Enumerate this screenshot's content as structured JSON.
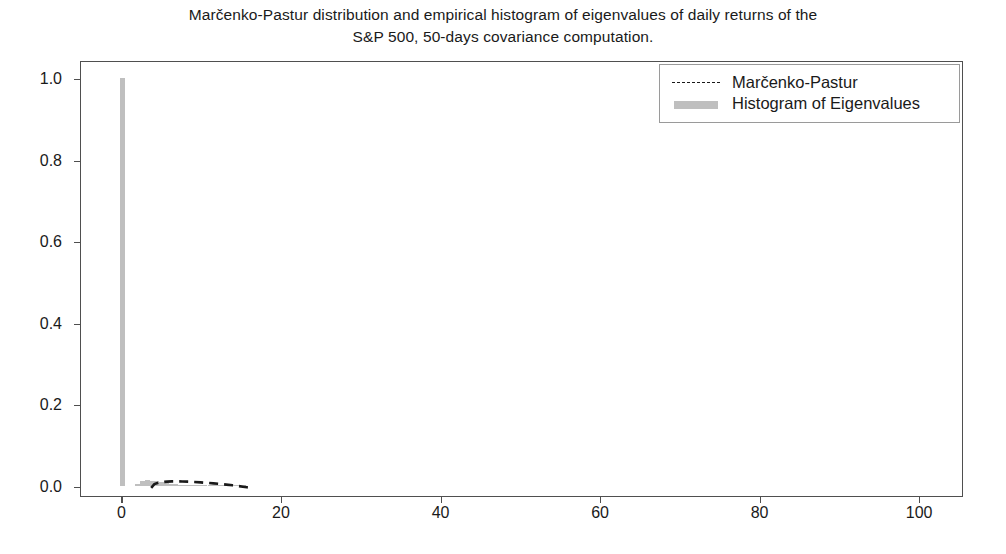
{
  "chart_data": {
    "type": "bar",
    "title": "Marčenko-Pastur distribution and empirical histogram of eigenvalues of daily returns of the S&P 500, 50-days covariance computation.",
    "title_line1": "Marčenko-Pastur distribution and empirical histogram of eigenvalues of daily returns of the",
    "title_line2": "S&P 500, 50-days covariance computation.",
    "xlabel": "",
    "ylabel": "",
    "xlim": [
      -5.2,
      105.5
    ],
    "ylim": [
      -0.025,
      1.045
    ],
    "grid": false,
    "legend_position": "upper right",
    "xticks": [
      0,
      20,
      40,
      60,
      80,
      100
    ],
    "xtick_labels": [
      "0",
      "20",
      "40",
      "60",
      "80",
      "100"
    ],
    "yticks": [
      0.0,
      0.2,
      0.4,
      0.6,
      0.8,
      1.0
    ],
    "ytick_labels": [
      "0.0",
      "0.2",
      "0.4",
      "0.6",
      "0.8",
      "1.0"
    ],
    "legend": [
      {
        "name": "Marčenko-Pastur",
        "marker": "dashed-line",
        "color": "#1a1a1a"
      },
      {
        "name": "Histogram of Eigenvalues",
        "marker": "filled-patch",
        "color": "#bfbfbf"
      }
    ],
    "series": [
      {
        "name": "Histogram of Eigenvalues",
        "type": "bar",
        "color": "#bfbfbf",
        "bin_width": 0.62,
        "bins": [
          {
            "x": 0.0,
            "value": 1.0
          },
          {
            "x": 1.9,
            "value": 0.004
          },
          {
            "x": 2.5,
            "value": 0.011
          },
          {
            "x": 3.1,
            "value": 0.014
          },
          {
            "x": 3.7,
            "value": 0.013
          },
          {
            "x": 4.3,
            "value": 0.012
          },
          {
            "x": 4.9,
            "value": 0.009
          },
          {
            "x": 5.5,
            "value": 0.007
          },
          {
            "x": 6.1,
            "value": 0.005
          },
          {
            "x": 6.7,
            "value": 0.004
          },
          {
            "x": 7.3,
            "value": 0.003
          },
          {
            "x": 7.9,
            "value": 0.003
          },
          {
            "x": 8.5,
            "value": 0.002
          },
          {
            "x": 9.1,
            "value": 0.002
          },
          {
            "x": 9.7,
            "value": 0.002
          },
          {
            "x": 10.3,
            "value": 0.0015
          },
          {
            "x": 11.0,
            "value": 0.0015
          },
          {
            "x": 11.6,
            "value": 0.001
          },
          {
            "x": 12.2,
            "value": 0.001
          },
          {
            "x": 12.8,
            "value": 0.001
          },
          {
            "x": 13.4,
            "value": 0.001
          },
          {
            "x": 14.0,
            "value": 0.0008
          },
          {
            "x": 14.6,
            "value": 0.0008
          },
          {
            "x": 15.2,
            "value": 0.0005
          }
        ]
      },
      {
        "name": "Marčenko-Pastur",
        "type": "line",
        "linestyle": "dashed",
        "color": "#1a1a1a",
        "x": [
          3.6,
          4.0,
          4.5,
          5.0,
          5.6,
          6.2,
          6.8,
          7.5,
          8.2,
          9.0,
          9.8,
          10.6,
          11.4,
          12.2,
          13.0,
          13.8,
          14.5,
          15.1,
          15.6,
          16.0
        ],
        "y": [
          0.0,
          0.009,
          0.0125,
          0.0142,
          0.0152,
          0.0157,
          0.0158,
          0.0156,
          0.0151,
          0.0143,
          0.0133,
          0.0121,
          0.0108,
          0.0094,
          0.0078,
          0.0061,
          0.0044,
          0.0028,
          0.0013,
          0.0
        ]
      }
    ]
  },
  "figure": {
    "background_color": "#ffffff",
    "axes_edge_color": "#4f4f4f",
    "tick_label_color": "#1a1a1a"
  }
}
